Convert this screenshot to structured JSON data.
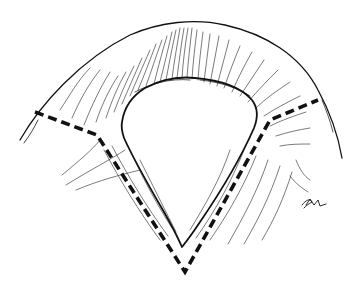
{
  "figure": {
    "kind": "medical line illustration",
    "annotation": "bold dashed V-shaped incision line with horizontal extensions on both sides",
    "signature": "artist initials (illegible) at lower right",
    "colors": {
      "ink": "#111111",
      "background": "#ffffff"
    }
  }
}
